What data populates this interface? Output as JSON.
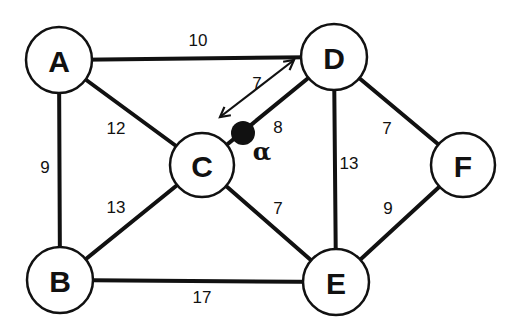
{
  "diagram": {
    "type": "weighted-graph",
    "nodes": [
      {
        "id": "A",
        "label": "A",
        "x": 59,
        "y": 60,
        "r": 33
      },
      {
        "id": "B",
        "label": "B",
        "x": 60,
        "y": 280,
        "r": 33
      },
      {
        "id": "C",
        "label": "C",
        "x": 202,
        "y": 165,
        "r": 32
      },
      {
        "id": "D",
        "label": "D",
        "x": 334,
        "y": 57,
        "r": 33
      },
      {
        "id": "E",
        "label": "E",
        "x": 336,
        "y": 282,
        "r": 33
      },
      {
        "id": "F",
        "label": "F",
        "x": 463,
        "y": 165,
        "r": 32
      }
    ],
    "edges": [
      {
        "from": "A",
        "to": "D",
        "weight": "10",
        "label_x": 198,
        "label_y": 40
      },
      {
        "from": "A",
        "to": "C",
        "weight": "12",
        "label_x": 116,
        "label_y": 128
      },
      {
        "from": "A",
        "to": "B",
        "weight": "9",
        "label_x": 45,
        "label_y": 167
      },
      {
        "from": "B",
        "to": "C",
        "weight": "13",
        "label_x": 116,
        "label_y": 207
      },
      {
        "from": "B",
        "to": "E",
        "weight": "17",
        "label_x": 202,
        "label_y": 297
      },
      {
        "from": "C",
        "to": "E",
        "weight": "7",
        "label_x": 278,
        "label_y": 208
      },
      {
        "from": "C",
        "to": "D",
        "weight": "8",
        "label_x": 278,
        "label_y": 127
      },
      {
        "from": "D",
        "to": "E",
        "weight": "13",
        "label_x": 349,
        "label_y": 163
      },
      {
        "from": "D",
        "to": "F",
        "weight": "7",
        "label_x": 387,
        "label_y": 128
      },
      {
        "from": "E",
        "to": "F",
        "weight": "9",
        "label_x": 388,
        "label_y": 208
      }
    ],
    "marker": {
      "label": "α",
      "x": 243,
      "y": 133,
      "r": 12,
      "label_x": 262,
      "label_y": 151
    },
    "distance_arrow": {
      "label": "7",
      "x1": 220,
      "y1": 117,
      "x2": 294,
      "y2": 60,
      "label_x": 257,
      "label_y": 83
    }
  }
}
